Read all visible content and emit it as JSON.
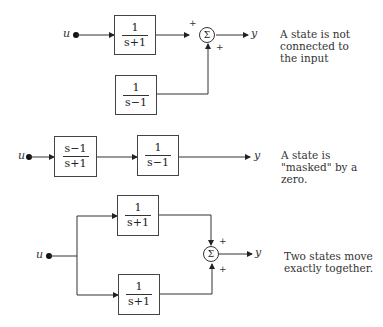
{
  "diagrams": [
    {
      "input_label": "u",
      "output_label": "y",
      "blocks": [
        {
          "num": "1",
          "den": "s+1"
        },
        {
          "num": "1",
          "den": "s−1"
        }
      ],
      "sum_symbol": "Σ",
      "signs": [
        "+",
        "+"
      ],
      "caption": "A state is not\nconnected to\nthe input"
    },
    {
      "input_label": "u",
      "output_label": "y",
      "blocks": [
        {
          "num": "s−1",
          "den": "s+1"
        },
        {
          "num": "1",
          "den": "s−1"
        }
      ],
      "caption": "A state is\n\"masked\" by a\nzero."
    },
    {
      "input_label": "u",
      "output_label": "y",
      "blocks": [
        {
          "num": "1",
          "den": "s+1"
        },
        {
          "num": "1",
          "den": "s+1"
        }
      ],
      "sum_symbol": "Σ",
      "signs": [
        "+",
        "+"
      ],
      "caption": "Two states move\nexactly together."
    }
  ]
}
